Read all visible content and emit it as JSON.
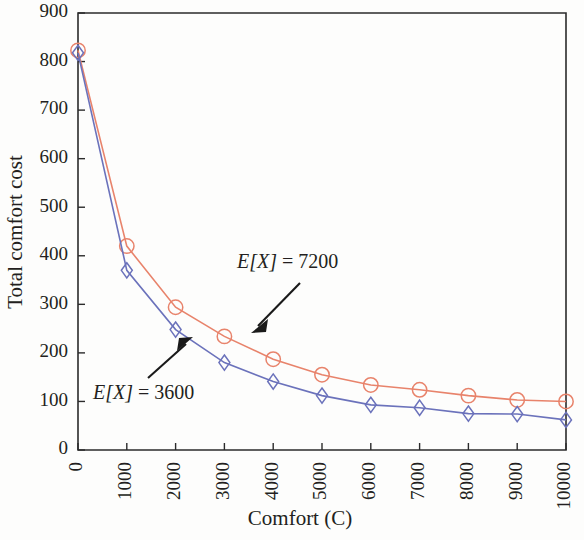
{
  "chart_data": {
    "type": "line",
    "title": "",
    "xlabel": "Comfort (C)",
    "ylabel": "Total comfort cost",
    "xlim": [
      0,
      10000
    ],
    "ylim": [
      0,
      900
    ],
    "xticks": [
      0,
      1000,
      2000,
      3000,
      4000,
      5000,
      6000,
      7000,
      8000,
      9000,
      10000
    ],
    "xticklabels": [
      "0",
      "1000",
      "2000",
      "3000",
      "4000",
      "5000",
      "6000",
      "7000",
      "8000",
      "9000",
      "10000"
    ],
    "yticks": [
      0,
      100,
      200,
      300,
      400,
      500,
      600,
      700,
      800,
      900
    ],
    "yticklabels": [
      "0",
      "100",
      "200",
      "300",
      "400",
      "500",
      "600",
      "700",
      "800",
      "900"
    ],
    "grid": false,
    "legend_position": "none",
    "x": [
      0,
      1000,
      2000,
      3000,
      4000,
      5000,
      6000,
      7000,
      8000,
      9000,
      10000
    ],
    "series": [
      {
        "name": "E[X] = 7200",
        "color": "#e8836b",
        "marker": "circle",
        "values": [
          823,
          420,
          294,
          234,
          187,
          155,
          134,
          124,
          112,
          103,
          100
        ]
      },
      {
        "name": "E[X] = 3600",
        "color": "#6b72bb",
        "marker": "diamond",
        "values": [
          818,
          370,
          248,
          180,
          141,
          112,
          93,
          87,
          75,
          74,
          62
        ]
      }
    ],
    "annotations": [
      {
        "name": "annotation-ex-7200",
        "text_italic": "E[X]",
        "text_rest": " = 7200",
        "text": "E[X] = 7200",
        "target_x": 3000,
        "target_y": 234
      },
      {
        "name": "annotation-ex-3600",
        "text_italic": "E[X]",
        "text_rest": " = 3600",
        "text": "E[X] = 3600",
        "target_x": 2400,
        "target_y": 215
      }
    ]
  },
  "figure": {
    "background_color": "#fdfdfc",
    "axis_color": "#2b2b2b",
    "red_series_color": "#e8836b",
    "blue_series_color": "#6b72bb"
  }
}
